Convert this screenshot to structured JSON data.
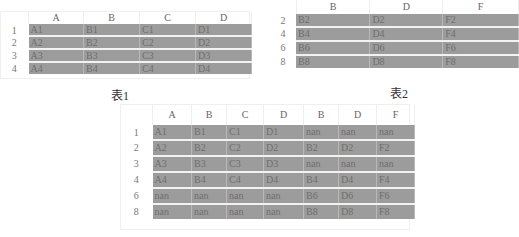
{
  "table1": {
    "caption": "表1",
    "columns": [
      "A",
      "B",
      "C",
      "D"
    ],
    "rows": [
      {
        "index": "1",
        "cells": [
          "A1",
          "B1",
          "C1",
          "D1"
        ]
      },
      {
        "index": "2",
        "cells": [
          "A2",
          "B2",
          "C2",
          "D2"
        ]
      },
      {
        "index": "3",
        "cells": [
          "A3",
          "B3",
          "C3",
          "D3"
        ]
      },
      {
        "index": "4",
        "cells": [
          "A4",
          "B4",
          "C4",
          "D4"
        ]
      }
    ]
  },
  "table2": {
    "caption": "表2",
    "columns": [
      "B",
      "D",
      "F"
    ],
    "rows": [
      {
        "index": "2",
        "cells": [
          "B2",
          "D2",
          "F2"
        ]
      },
      {
        "index": "4",
        "cells": [
          "B4",
          "D4",
          "F4"
        ]
      },
      {
        "index": "6",
        "cells": [
          "B6",
          "D6",
          "F6"
        ]
      },
      {
        "index": "8",
        "cells": [
          "B8",
          "D8",
          "F8"
        ]
      }
    ]
  },
  "table3": {
    "columns": [
      "A",
      "B",
      "C",
      "D",
      "B",
      "D",
      "F"
    ],
    "rows": [
      {
        "index": "1",
        "cells": [
          "A1",
          "B1",
          "C1",
          "D1",
          "nan",
          "nan",
          "nan"
        ]
      },
      {
        "index": "2",
        "cells": [
          "A2",
          "B2",
          "C2",
          "D2",
          "B2",
          "D2",
          "F2"
        ]
      },
      {
        "index": "3",
        "cells": [
          "A3",
          "B3",
          "C3",
          "D3",
          "nan",
          "nan",
          "nan"
        ]
      },
      {
        "index": "4",
        "cells": [
          "A4",
          "B4",
          "C4",
          "D4",
          "B4",
          "D4",
          "F4"
        ]
      },
      {
        "index": "6",
        "cells": [
          "nan",
          "nan",
          "nan",
          "nan",
          "B6",
          "D6",
          "F6"
        ]
      },
      {
        "index": "8",
        "cells": [
          "nan",
          "nan",
          "nan",
          "nan",
          "B8",
          "D8",
          "F8"
        ]
      }
    ]
  },
  "colors": {
    "cell_fill": "#9c9c9c",
    "cell_text": "#6f6f6f",
    "separator": "#f2f2f2"
  }
}
